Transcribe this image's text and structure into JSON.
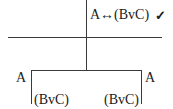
{
  "tree": {
    "root_formula": "A↔(BvC)",
    "root_mark": "✓",
    "left_branch": {
      "formula_1": "A",
      "formula_2": "(BvC)"
    },
    "right_branch": {
      "formula_1": "A",
      "formula_2": "(BvC)"
    }
  }
}
